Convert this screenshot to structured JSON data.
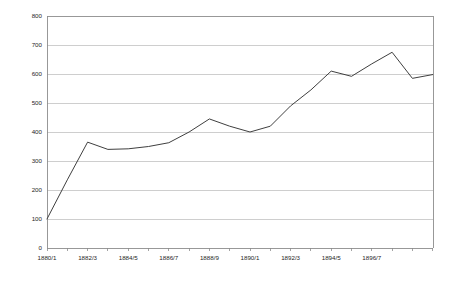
{
  "chart_data": {
    "type": "line",
    "title": "",
    "subtitle": "",
    "xlabel": "",
    "ylabel": "",
    "grid": "horizontal",
    "legend": "none",
    "ylim": [
      0,
      800
    ],
    "ytick_labels": [
      "800",
      "700",
      "600",
      "500",
      "400",
      "300",
      "200",
      "100",
      "0"
    ],
    "ytick_values": [
      800,
      700,
      600,
      500,
      400,
      300,
      200,
      100,
      0
    ],
    "xtick_labels": [
      "1880/1",
      "1882/3",
      "1884/5",
      "1886/7",
      "1888/9",
      "1890/1",
      "1892/3",
      "1894/5",
      "1896/7"
    ],
    "x": [
      "1880/1",
      "1881/2",
      "1882/3",
      "1883/4",
      "1884/5",
      "1885/6",
      "1886/7",
      "1887/8",
      "1888/9",
      "1889/90",
      "1890/1",
      "1891/2",
      "1892/3",
      "1893/4",
      "1894/5",
      "1895/6",
      "1896/7",
      "1897/8",
      "1898/9",
      "1899/1900"
    ],
    "series": [
      {
        "name": "series-1",
        "color": "#3f3f3f",
        "values": [
          100,
          235,
          365,
          340,
          342,
          350,
          363,
          400,
          445,
          420,
          400,
          420,
          490,
          545,
          610,
          592,
          635,
          675,
          585,
          598
        ]
      }
    ]
  },
  "colors": {
    "line": "#3f3f3f",
    "grid": "#b9b9b9",
    "axis": "#8d8d8d",
    "background": "#ffffff",
    "text": "#262626"
  },
  "geometry": {
    "plot_left": 47,
    "plot_right": 433,
    "plot_top": 16,
    "plot_bottom": 248,
    "x_step": 20.3
  }
}
